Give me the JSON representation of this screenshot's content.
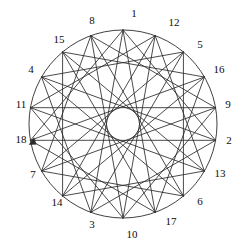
{
  "figure": {
    "type": "circular-graph-diagram",
    "title": "",
    "background_color": "#ffffff",
    "stroke_color": "#2b2b2b",
    "label_color": "#0d0d0d",
    "circle": {
      "center_x": 123,
      "center_y": 124,
      "radius": 94,
      "stroke_width": 0.9
    },
    "vertex_count": 18,
    "label_radius": 110,
    "chord_stroke_width": 0.85,
    "label_sequence_note": "clockwise from top, step +11 mod 18",
    "vertices": [
      {
        "label": "1",
        "slot": 0,
        "angle_deg": -90,
        "label_x": 134,
        "label_y": 13
      },
      {
        "label": "12",
        "slot": 1,
        "angle_deg": -70,
        "label_x": 174,
        "label_y": 22
      },
      {
        "label": "5",
        "slot": 2,
        "angle_deg": -50,
        "label_x": 200,
        "label_y": 44
      },
      {
        "label": "16",
        "slot": 3,
        "angle_deg": -30,
        "label_x": 219,
        "label_y": 69
      },
      {
        "label": "9",
        "slot": 4,
        "angle_deg": -10,
        "label_x": 228,
        "label_y": 104
      },
      {
        "label": "2",
        "slot": 5,
        "angle_deg": 10,
        "label_x": 229,
        "label_y": 140
      },
      {
        "label": "13",
        "slot": 6,
        "angle_deg": 30,
        "label_x": 220,
        "label_y": 173
      },
      {
        "label": "6",
        "slot": 7,
        "angle_deg": 50,
        "label_x": 200,
        "label_y": 201
      },
      {
        "label": "17",
        "slot": 8,
        "angle_deg": 70,
        "label_x": 171,
        "label_y": 221
      },
      {
        "label": "10",
        "slot": 9,
        "angle_deg": 90,
        "label_x": 132,
        "label_y": 234
      },
      {
        "label": "3",
        "slot": 10,
        "angle_deg": 110,
        "label_x": 92,
        "label_y": 224
      },
      {
        "label": "14",
        "slot": 11,
        "angle_deg": 130,
        "label_x": 57,
        "label_y": 202
      },
      {
        "label": "7",
        "slot": 12,
        "angle_deg": 150,
        "label_x": 33,
        "label_y": 174
      },
      {
        "label": "18",
        "slot": 13,
        "angle_deg": 170,
        "label_x": 21,
        "label_y": 139
      },
      {
        "label": "11",
        "slot": 14,
        "angle_deg": 190,
        "label_x": 21,
        "label_y": 104
      },
      {
        "label": "4",
        "slot": 15,
        "angle_deg": 210,
        "label_x": 31,
        "label_y": 69
      },
      {
        "label": "15",
        "slot": 16,
        "angle_deg": 230,
        "label_x": 59,
        "label_y": 39
      },
      {
        "label": "8",
        "slot": 17,
        "angle_deg": 250,
        "label_x": 92,
        "label_y": 20
      }
    ],
    "edges": [
      {
        "from": "1",
        "to": "2"
      },
      {
        "from": "2",
        "to": "3"
      },
      {
        "from": "3",
        "to": "4"
      },
      {
        "from": "4",
        "to": "5"
      },
      {
        "from": "5",
        "to": "6"
      },
      {
        "from": "6",
        "to": "7"
      },
      {
        "from": "7",
        "to": "8"
      },
      {
        "from": "8",
        "to": "9"
      },
      {
        "from": "9",
        "to": "10"
      },
      {
        "from": "10",
        "to": "11"
      },
      {
        "from": "11",
        "to": "12"
      },
      {
        "from": "12",
        "to": "13"
      },
      {
        "from": "13",
        "to": "14"
      },
      {
        "from": "14",
        "to": "15"
      },
      {
        "from": "15",
        "to": "16"
      },
      {
        "from": "16",
        "to": "17"
      },
      {
        "from": "17",
        "to": "18"
      },
      {
        "from": "18",
        "to": "1"
      },
      {
        "from": "1",
        "to": "3"
      },
      {
        "from": "2",
        "to": "4"
      },
      {
        "from": "3",
        "to": "5"
      },
      {
        "from": "4",
        "to": "6"
      },
      {
        "from": "5",
        "to": "7"
      },
      {
        "from": "6",
        "to": "8"
      },
      {
        "from": "7",
        "to": "9"
      },
      {
        "from": "8",
        "to": "10"
      },
      {
        "from": "9",
        "to": "11"
      },
      {
        "from": "10",
        "to": "12"
      },
      {
        "from": "11",
        "to": "13"
      },
      {
        "from": "12",
        "to": "14"
      },
      {
        "from": "13",
        "to": "15"
      },
      {
        "from": "14",
        "to": "16"
      },
      {
        "from": "15",
        "to": "17"
      },
      {
        "from": "16",
        "to": "18"
      },
      {
        "from": "17",
        "to": "1"
      },
      {
        "from": "18",
        "to": "2"
      }
    ],
    "marker": {
      "name": "arrowhead",
      "at_label": "18",
      "direction_deg": 35,
      "size": 7
    }
  }
}
